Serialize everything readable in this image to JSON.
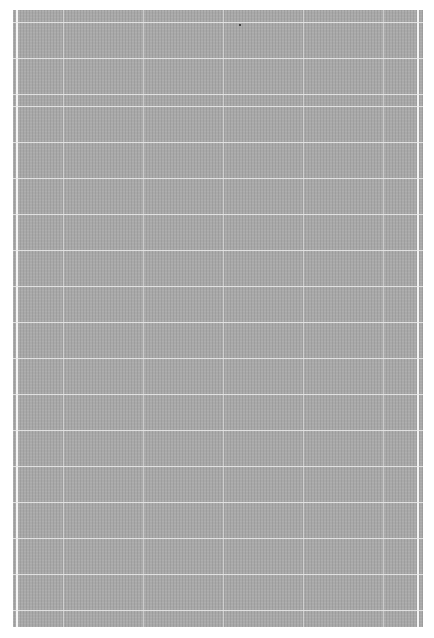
{
  "image": {
    "description": "Scanned gray textured grid sheet",
    "background_color": "#ffffff",
    "sheet_color": "#a9a9a9",
    "grid_line_color": "#ebebeb"
  },
  "grid": {
    "horizontal_lines_y": [
      12,
      48,
      84,
      96,
      132,
      168,
      204,
      240,
      276,
      312,
      348,
      384,
      420,
      456,
      492,
      528,
      564,
      600
    ],
    "vertical_lines_x": [
      50,
      130,
      210,
      290,
      370
    ]
  }
}
